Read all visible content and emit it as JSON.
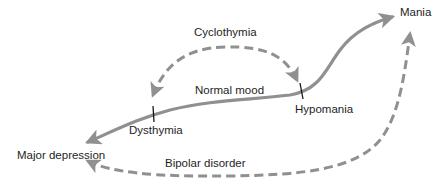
{
  "diagram": {
    "colors": {
      "curve": "#909090",
      "tick": "#111111",
      "text": "#1e1e1e",
      "background": "#ffffff"
    },
    "states": [
      {
        "id": "major-depression",
        "label": "Major depression"
      },
      {
        "id": "dysthymia",
        "label": "Dysthymia"
      },
      {
        "id": "normal-mood",
        "label": "Normal mood"
      },
      {
        "id": "hypomania",
        "label": "Hypomania"
      },
      {
        "id": "mania",
        "label": "Mania"
      }
    ],
    "cycles": [
      {
        "id": "cyclothymia",
        "label": "Cyclothymia",
        "from": "hypomania",
        "to": "dysthymia",
        "style": "dashed"
      },
      {
        "id": "bipolar-disorder",
        "label": "Bipolar disorder",
        "from": "major-depression",
        "to": "mania",
        "style": "dashed"
      }
    ],
    "mood_axis": {
      "style": "solid",
      "from": "major-depression",
      "to": "mania",
      "bidirectional": true
    }
  }
}
